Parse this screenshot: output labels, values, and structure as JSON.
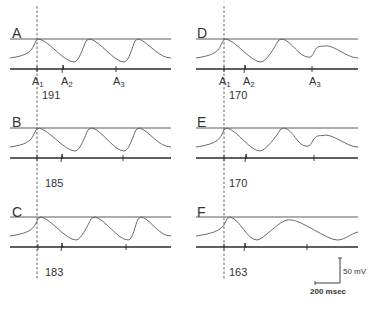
{
  "figure": {
    "panels": [
      {
        "id": "A",
        "label": "A",
        "interval": "191",
        "column": 0,
        "row": 0,
        "stim_labels": [
          "A1",
          "A2",
          "A3"
        ],
        "peaks": [
          {
            "x": 37,
            "amp": 1.0
          },
          {
            "x": 88,
            "amp": 1.0
          },
          {
            "x": 137,
            "amp": 1.0
          }
        ],
        "troughs": [
          {
            "x": 74,
            "depth": 1.0
          },
          {
            "x": 124,
            "depth": 1.0
          }
        ],
        "stim_ticks": [
          37,
          63,
          116
        ]
      },
      {
        "id": "B",
        "label": "B",
        "interval": "185",
        "column": 0,
        "row": 1,
        "stim_labels": [],
        "peaks": [
          {
            "x": 37,
            "amp": 1.0
          },
          {
            "x": 90,
            "amp": 1.0
          },
          {
            "x": 138,
            "amp": 1.0
          }
        ],
        "troughs": [
          {
            "x": 75,
            "depth": 1.0
          },
          {
            "x": 124,
            "depth": 1.0
          }
        ],
        "stim_ticks": [
          37,
          62,
          123
        ]
      },
      {
        "id": "C",
        "label": "C",
        "interval": "183",
        "column": 0,
        "row": 2,
        "stim_labels": [],
        "peaks": [
          {
            "x": 39,
            "amp": 1.0
          },
          {
            "x": 93,
            "amp": 1.0
          },
          {
            "x": 140,
            "amp": 1.0
          }
        ],
        "troughs": [
          {
            "x": 76,
            "depth": 1.0
          },
          {
            "x": 128,
            "depth": 1.0
          }
        ],
        "stim_ticks": [
          38,
          62,
          126
        ]
      },
      {
        "id": "D",
        "label": "D",
        "interval": "170",
        "column": 1,
        "row": 0,
        "stim_labels": [
          "A1",
          "A2",
          "A3"
        ],
        "peaks": [
          {
            "x": 224,
            "amp": 1.0
          },
          {
            "x": 280,
            "amp": 1.0
          },
          {
            "x": 321,
            "amp": 0.62
          }
        ],
        "troughs": [
          {
            "x": 261,
            "depth": 1.0
          },
          {
            "x": 309,
            "depth": 0.75
          }
        ],
        "stim_ticks": [
          224,
          245,
          312
        ]
      },
      {
        "id": "E",
        "label": "E",
        "interval": "170",
        "column": 1,
        "row": 1,
        "stim_labels": [],
        "peaks": [
          {
            "x": 225,
            "amp": 1.0
          },
          {
            "x": 282,
            "amp": 1.0
          },
          {
            "x": 320,
            "amp": 0.6
          }
        ],
        "troughs": [
          {
            "x": 260,
            "depth": 1.0
          },
          {
            "x": 307,
            "depth": 0.75
          }
        ],
        "stim_ticks": [
          224,
          246,
          314
        ]
      },
      {
        "id": "F",
        "label": "F",
        "interval": "163",
        "column": 1,
        "row": 2,
        "stim_labels": [],
        "peaks": [
          {
            "x": 228,
            "amp": 1.0
          },
          {
            "x": 288,
            "amp": 0.85
          }
        ],
        "troughs": [
          {
            "x": 257,
            "depth": 1.0
          },
          {
            "x": 337,
            "depth": 1.0
          }
        ],
        "stim_ticks": [
          224,
          245,
          307
        ]
      }
    ],
    "scale_bar": {
      "voltage_label": "50 mV",
      "time_label": "200 msec"
    },
    "colors": {
      "trace": "#5a5a5a",
      "reference_line": "#4a4a4a",
      "stim_line": "#2a2a2a",
      "dashed": "#555555",
      "text": "#333333"
    }
  }
}
